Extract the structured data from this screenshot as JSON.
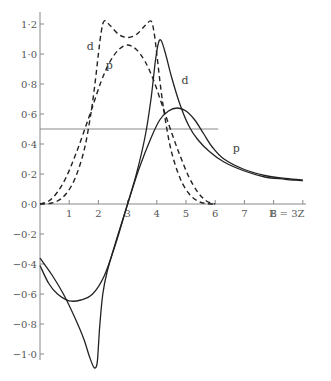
{
  "chart_data": {
    "type": "line",
    "title": "",
    "xlabel": "E = 3Z",
    "ylabel": "",
    "xlim": [
      0,
      9
    ],
    "ylim": [
      -1.1,
      1.25
    ],
    "grid": false,
    "x_ticks": [
      {
        "value": 1,
        "label": "1"
      },
      {
        "value": 2,
        "label": "2"
      },
      {
        "value": 3,
        "label": "3"
      },
      {
        "value": 4,
        "label": "4"
      },
      {
        "value": 5,
        "label": "5"
      },
      {
        "value": 6,
        "label": "6"
      },
      {
        "value": 7,
        "label": "7"
      },
      {
        "value": 8,
        "label": "8"
      },
      {
        "value": 9,
        "label": "E = 3Z"
      }
    ],
    "y_ticks": [
      {
        "value": 1.2,
        "label": "1·2"
      },
      {
        "value": 1.0,
        "label": "1·0"
      },
      {
        "value": 0.8,
        "label": "0·8"
      },
      {
        "value": 0.6,
        "label": "0·6"
      },
      {
        "value": 0.4,
        "label": "0·4"
      },
      {
        "value": 0.2,
        "label": "0·2"
      },
      {
        "value": 0.0,
        "label": "0·0"
      },
      {
        "value": -0.2,
        "label": "−0·2"
      },
      {
        "value": -0.4,
        "label": "−0·4"
      },
      {
        "value": -0.6,
        "label": "−0·6"
      },
      {
        "value": -0.8,
        "label": "−0·8"
      },
      {
        "value": -1.0,
        "label": "−1·0"
      }
    ],
    "reference_line": {
      "y": 0.5,
      "x_range": [
        0,
        6.0
      ]
    },
    "series": [
      {
        "name": "d (dashed)",
        "style": "dashed",
        "label": "d",
        "label_at": [
          1.6,
          1.03
        ],
        "points": [
          [
            0,
            0
          ],
          [
            0.3,
            0.003
          ],
          [
            0.6,
            0.02
          ],
          [
            0.9,
            0.07
          ],
          [
            1.2,
            0.17
          ],
          [
            1.5,
            0.35
          ],
          [
            1.7,
            0.55
          ],
          [
            1.85,
            0.75
          ],
          [
            2.0,
            1.0
          ],
          [
            2.1,
            1.15
          ],
          [
            2.2,
            1.22
          ],
          [
            2.4,
            1.19
          ],
          [
            2.7,
            1.13
          ],
          [
            3.0,
            1.11
          ],
          [
            3.3,
            1.13
          ],
          [
            3.6,
            1.19
          ],
          [
            3.8,
            1.22
          ],
          [
            3.9,
            1.15
          ],
          [
            4.0,
            1.0
          ],
          [
            4.15,
            0.75
          ],
          [
            4.3,
            0.55
          ],
          [
            4.5,
            0.35
          ],
          [
            4.8,
            0.17
          ],
          [
            5.1,
            0.07
          ],
          [
            5.4,
            0.02
          ],
          [
            5.7,
            0.003
          ],
          [
            6.0,
            0
          ]
        ]
      },
      {
        "name": "p (dashed)",
        "style": "dashed",
        "label": "p",
        "label_at": [
          2.25,
          0.9
        ],
        "points": [
          [
            0,
            0
          ],
          [
            0.3,
            0.02
          ],
          [
            0.6,
            0.08
          ],
          [
            0.9,
            0.18
          ],
          [
            1.2,
            0.32
          ],
          [
            1.5,
            0.48
          ],
          [
            1.8,
            0.65
          ],
          [
            2.1,
            0.82
          ],
          [
            2.4,
            0.95
          ],
          [
            2.7,
            1.03
          ],
          [
            3.0,
            1.06
          ],
          [
            3.3,
            1.03
          ],
          [
            3.6,
            0.95
          ],
          [
            3.9,
            0.82
          ],
          [
            4.2,
            0.65
          ],
          [
            4.5,
            0.48
          ],
          [
            4.8,
            0.32
          ],
          [
            5.1,
            0.18
          ],
          [
            5.4,
            0.08
          ],
          [
            5.7,
            0.02
          ],
          [
            6.0,
            0
          ]
        ]
      },
      {
        "name": "d (solid)",
        "style": "solid",
        "label": "d",
        "label_at": [
          4.85,
          0.8
        ],
        "points": [
          [
            0,
            -0.36
          ],
          [
            0.4,
            -0.47
          ],
          [
            0.8,
            -0.6
          ],
          [
            1.2,
            -0.76
          ],
          [
            1.5,
            -0.9
          ],
          [
            1.7,
            -1.02
          ],
          [
            1.85,
            -1.09
          ],
          [
            1.95,
            -1.07
          ],
          [
            2.0,
            -0.95
          ],
          [
            2.05,
            -0.8
          ],
          [
            2.15,
            -0.6
          ],
          [
            2.3,
            -0.45
          ],
          [
            2.6,
            -0.25
          ],
          [
            3.0,
            0.0
          ],
          [
            3.3,
            0.2
          ],
          [
            3.6,
            0.45
          ],
          [
            3.8,
            0.7
          ],
          [
            3.95,
            0.95
          ],
          [
            4.05,
            1.07
          ],
          [
            4.15,
            1.09
          ],
          [
            4.3,
            1.0
          ],
          [
            4.5,
            0.85
          ],
          [
            4.8,
            0.66
          ],
          [
            5.1,
            0.52
          ],
          [
            5.4,
            0.43
          ],
          [
            5.8,
            0.35
          ],
          [
            6.3,
            0.28
          ],
          [
            7.0,
            0.22
          ],
          [
            7.7,
            0.18
          ],
          [
            8.4,
            0.165
          ],
          [
            9.0,
            0.155
          ]
        ]
      },
      {
        "name": "p (solid)",
        "style": "solid",
        "label": "p",
        "label_at": [
          6.6,
          0.35
        ],
        "points": [
          [
            0,
            -0.41
          ],
          [
            0.3,
            -0.53
          ],
          [
            0.6,
            -0.6
          ],
          [
            1.0,
            -0.645
          ],
          [
            1.4,
            -0.64
          ],
          [
            1.8,
            -0.6
          ],
          [
            2.2,
            -0.48
          ],
          [
            2.6,
            -0.26
          ],
          [
            3.0,
            0.0
          ],
          [
            3.4,
            0.24
          ],
          [
            3.8,
            0.44
          ],
          [
            4.1,
            0.56
          ],
          [
            4.4,
            0.62
          ],
          [
            4.7,
            0.64
          ],
          [
            5.0,
            0.62
          ],
          [
            5.3,
            0.56
          ],
          [
            5.6,
            0.47
          ],
          [
            5.9,
            0.38
          ],
          [
            6.3,
            0.3
          ],
          [
            7.0,
            0.23
          ],
          [
            7.7,
            0.19
          ],
          [
            8.4,
            0.17
          ],
          [
            9.0,
            0.16
          ]
        ]
      }
    ]
  }
}
